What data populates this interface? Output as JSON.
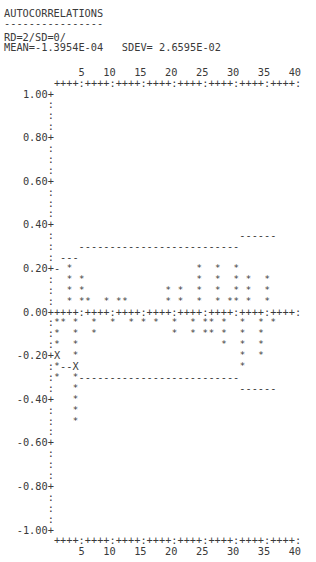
{
  "header": {
    "title": "AUTOCORRELATIONS",
    "underline": "----------------",
    "subtitle": "RD=2/SD=0/",
    "stats": "MEAN=-1.3954E-04   SDEV= 2.6595E-02"
  },
  "chart_data": {
    "type": "bar",
    "title": "AUTOCORRELATIONS",
    "subtitle": "RD=2/SD=0/",
    "mean": "-1.3954E-04",
    "sdev": "2.6595E-02",
    "xlabel": "Lag",
    "ylabel": "Autocorrelation",
    "x_tick_labels": [
      "5",
      "10",
      "15",
      "20",
      "25",
      "30",
      "35",
      "40"
    ],
    "y_tick_labels": [
      "1.00",
      "0.80",
      "0.60",
      "0.40",
      "0.20",
      "0.00",
      "-0.20",
      "-0.40",
      "-0.60",
      "-0.80",
      "-1.00"
    ],
    "ylim": [
      -1.0,
      1.0
    ],
    "xlim": [
      1,
      40
    ],
    "marker": "*",
    "limit_marker": "X",
    "categories": [
      1,
      2,
      3,
      4,
      5,
      6,
      7,
      8,
      9,
      10,
      11,
      12,
      13,
      14,
      15,
      16,
      17,
      18,
      19,
      20,
      21,
      22,
      23,
      24,
      25,
      26,
      27,
      28,
      29,
      30,
      31,
      32,
      33,
      34,
      35,
      36,
      37,
      38,
      39,
      40
    ],
    "values": [
      -0.3,
      -0.05,
      0.2,
      -0.5,
      0.15,
      0.05,
      -0.1,
      0.0,
      0.05,
      -0.05,
      0.05,
      0.05,
      -0.05,
      0.0,
      -0.05,
      0.0,
      -0.05,
      0.0,
      0.1,
      -0.1,
      0.1,
      0.0,
      -0.1,
      0.2,
      -0.1,
      -0.1,
      0.2,
      -0.15,
      0.05,
      0.2,
      -0.25,
      0.15,
      0.0,
      -0.2,
      0.15,
      -0.05,
      0.0,
      0.0,
      0.0,
      0.0
    ],
    "confidence_limits": [
      {
        "lags": [
          1,
          1
        ],
        "upper": 0.2,
        "lower": -0.2
      },
      {
        "lags": [
          2,
          4
        ],
        "upper": 0.25,
        "lower": -0.25
      },
      {
        "lags": [
          5,
          30
        ],
        "upper": 0.3,
        "lower": -0.3
      },
      {
        "lags": [
          31,
          36
        ],
        "upper": 0.35,
        "lower": -0.35
      }
    ],
    "grid": false
  }
}
